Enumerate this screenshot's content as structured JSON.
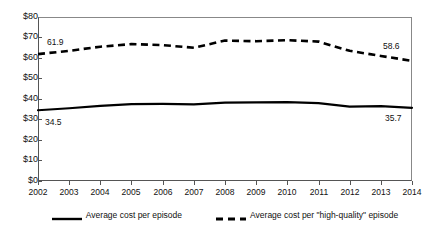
{
  "chart_data": {
    "type": "line",
    "title": "",
    "subtitle": "",
    "xlabel": "",
    "ylabel": "",
    "categories": [
      "2002",
      "2003",
      "2004",
      "2005",
      "2006",
      "2007",
      "2008",
      "2009",
      "2010",
      "2011",
      "2012",
      "2013",
      "2014"
    ],
    "ylim": [
      0,
      80
    ],
    "ytick_values": [
      0,
      10,
      20,
      30,
      40,
      50,
      60,
      70,
      80
    ],
    "ytick_labels": [
      "$0",
      "$10",
      "$20",
      "$30",
      "$40",
      "$50",
      "$60",
      "$70",
      "$80"
    ],
    "grid": false,
    "legend_position": "bottom",
    "series": [
      {
        "name": "Average cost per episode",
        "style": "solid",
        "color": "#000000",
        "values": [
          34.5,
          35.5,
          36.6,
          37.5,
          37.6,
          37.4,
          38.2,
          38.4,
          38.5,
          38.0,
          36.3,
          36.5,
          35.7
        ]
      },
      {
        "name": "Average cost per \"high-quality\" episode",
        "style": "dashed",
        "color": "#000000",
        "values": [
          61.9,
          63.5,
          65.5,
          66.8,
          66.3,
          65.0,
          68.5,
          68.2,
          68.7,
          68.0,
          63.5,
          61.0,
          58.6
        ]
      }
    ],
    "annotations": [
      {
        "text": "61.9",
        "series": 1,
        "index": 0,
        "position": "above-right"
      },
      {
        "text": "58.6",
        "series": 1,
        "index": 12,
        "position": "above-left"
      },
      {
        "text": "34.5",
        "series": 0,
        "index": 0,
        "position": "below-right"
      },
      {
        "text": "35.7",
        "series": 0,
        "index": 12,
        "position": "below-left"
      }
    ]
  },
  "legend": {
    "entries": [
      {
        "label": "Average cost per episode",
        "style": "solid"
      },
      {
        "label": "Average cost per \"high-quality\" episode",
        "style": "dashed"
      }
    ]
  }
}
